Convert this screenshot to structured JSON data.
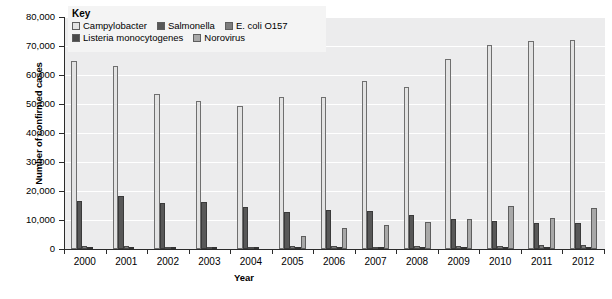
{
  "legend": {
    "title": "Key",
    "rows": [
      [
        {
          "label": "Campylobacter",
          "color": "#e3e3e3"
        },
        {
          "label": "Salmonella",
          "color": "#585858"
        },
        {
          "label": "E. coli O157",
          "color": "#7d7d7d"
        }
      ],
      [
        {
          "label": "Listeria monocytogenes",
          "color": "#4a4a4a"
        },
        {
          "label": "Norovirus",
          "color": "#a8a8a8"
        }
      ]
    ]
  },
  "chart_data": {
    "type": "bar",
    "title": "",
    "xlabel": "Year",
    "ylabel": "Number of confirmed cases",
    "ylim": [
      0,
      80000
    ],
    "ytick_labels": [
      "80,000",
      "70,000",
      "60,000",
      "50,000",
      "40,000",
      "30,000",
      "20,000",
      "10,000",
      "0"
    ],
    "ytick_values": [
      80000,
      70000,
      60000,
      50000,
      40000,
      30000,
      20000,
      10000,
      0
    ],
    "grid": true,
    "legend_position": "top-left-inside",
    "categories": [
      "2000",
      "2001",
      "2002",
      "2003",
      "2004",
      "2005",
      "2006",
      "2007",
      "2008",
      "2009",
      "2010",
      "2011",
      "2012"
    ],
    "series": [
      {
        "name": "Campylobacter",
        "color": "#e3e3e3",
        "values": [
          65000,
          63000,
          53500,
          51000,
          49300,
          52300,
          52300,
          58000,
          55700,
          65500,
          70200,
          71700,
          72000
        ]
      },
      {
        "name": "Salmonella",
        "color": "#585858",
        "values": [
          16600,
          18200,
          15700,
          16200,
          14600,
          12700,
          13600,
          13000,
          11600,
          10200,
          9800,
          8900,
          8800
        ]
      },
      {
        "name": "E. coli O157",
        "color": "#7d7d7d",
        "values": [
          1000,
          900,
          600,
          700,
          800,
          900,
          1200,
          800,
          1000,
          1100,
          1200,
          1400,
          1300
        ]
      },
      {
        "name": "Listeria monocytogenes",
        "color": "#4a4a4a",
        "values": [
          200,
          250,
          250,
          300,
          300,
          250,
          250,
          250,
          280,
          250,
          250,
          250,
          250
        ]
      },
      {
        "name": "Norovirus",
        "color": "#a8a8a8",
        "values": [
          0,
          0,
          0,
          0,
          0,
          4500,
          7400,
          8400,
          9200,
          10300,
          14800,
          10600,
          14200
        ]
      }
    ]
  }
}
